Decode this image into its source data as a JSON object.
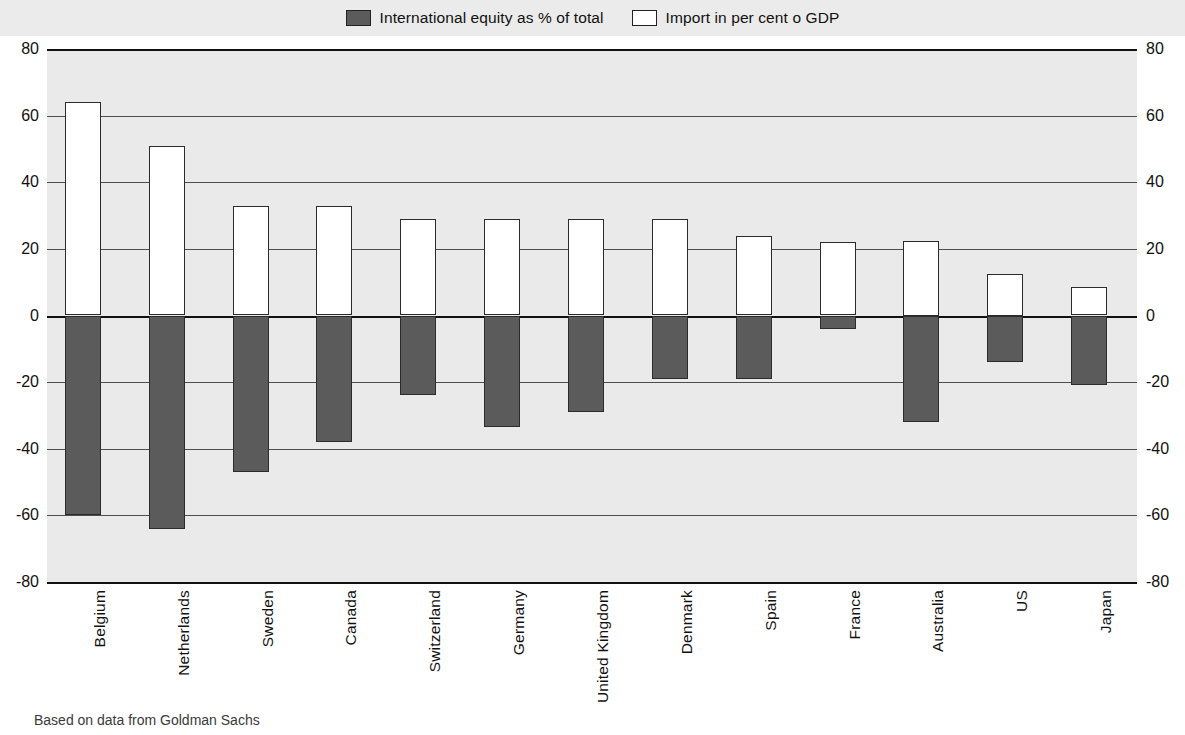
{
  "legend": {
    "items": [
      {
        "label": "International equity as % of total",
        "color": "#5b5b5b",
        "swatch": "filled-dark-swatch"
      },
      {
        "label": "Import in per cent o GDP",
        "color": "#ffffff",
        "swatch": "outlined-white-swatch"
      }
    ]
  },
  "source": {
    "prefix": "",
    "text": "Based on data from Goldman Sachs"
  },
  "chart_data": {
    "type": "bar",
    "title": "",
    "subtitle": "",
    "xlabel": "",
    "ylabel": "",
    "ylim": [
      -80,
      80
    ],
    "ytick_values": [
      80,
      60,
      40,
      20,
      0,
      -20,
      -40,
      -60,
      -80
    ],
    "ytick_labels": [
      "80",
      "60",
      "40",
      "20",
      "0",
      "-20",
      "-40",
      "-60",
      "-80"
    ],
    "grid": true,
    "legend_position": "top-center",
    "dual_y_axis": true,
    "categories": [
      "Belgium",
      "Netherlands",
      "Sweden",
      "Canada",
      "Switzerland",
      "Germany",
      "United Kingdom",
      "Denmark",
      "Spain",
      "France",
      "Australia",
      "US",
      "Japan"
    ],
    "series": [
      {
        "name": "Import in per cent o GDP",
        "color": "#ffffff",
        "values": [
          64,
          51,
          33,
          33,
          29,
          29,
          29,
          29,
          24,
          22,
          22.5,
          12.5,
          8.5
        ]
      },
      {
        "name": "International equity as % of total",
        "color": "#5b5b5b",
        "values": [
          -60,
          -64,
          -47,
          -38,
          -24,
          -33.5,
          -29,
          -19,
          -19,
          -4,
          -32,
          -14,
          -21
        ]
      }
    ]
  }
}
